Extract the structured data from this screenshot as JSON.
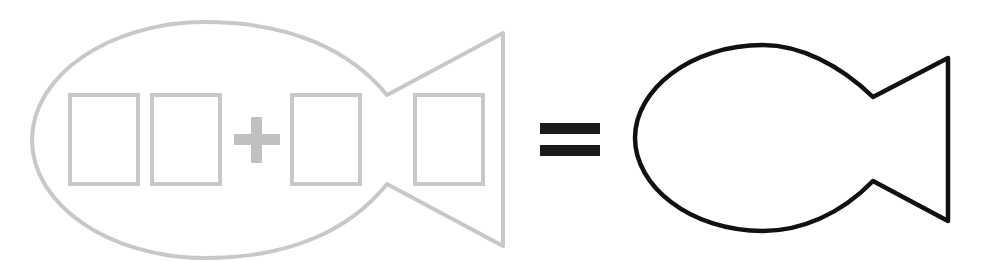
{
  "diagram": {
    "colors": {
      "ghost_stroke": "#c8c8c8",
      "ghost_fill": "#c0c0c0",
      "solid_stroke": "#111111",
      "equals": "#1a1a1a",
      "background": "#ffffff"
    },
    "left_fish": {
      "label": "equation-fish",
      "boxes": [
        {
          "id": "digit-1",
          "value": ""
        },
        {
          "id": "digit-2",
          "value": ""
        },
        {
          "id": "digit-3",
          "value": ""
        },
        {
          "id": "digit-4-tail",
          "value": ""
        }
      ],
      "operator": "+"
    },
    "equals_sign": "=",
    "right_fish": {
      "label": "answer-fish",
      "value": ""
    }
  }
}
